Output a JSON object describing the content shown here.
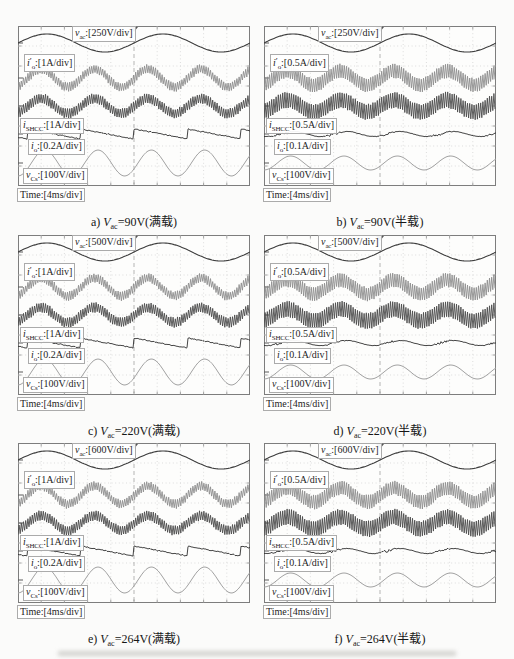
{
  "figure": {
    "background": "#fbfbfa"
  },
  "chart_data": {
    "type": "line",
    "time_per_div": "4ms/div",
    "divisions": {
      "x": 10,
      "y": 8
    },
    "colors": {
      "vac_trace": "#3c3c3c",
      "io_prime_trace": "#8f8f8f",
      "ishcc_trace": "#4c4c4c",
      "io_trace": "#303030",
      "vcs_trace": "#a2a2a2",
      "grid": "#d0d0d0",
      "border": "#7d7d7d"
    },
    "waveform_shapes": {
      "vac": {
        "type": "sine",
        "cycles": 2,
        "center": 17,
        "amp": 9
      },
      "io_prime": {
        "type": "band",
        "cycles": 4.35,
        "phase_peak": 0.1,
        "center": 52,
        "amp_full": 9,
        "amp_half": 7,
        "halfwidth_full": 4,
        "halfwidth_half": 6.5
      },
      "ishcc": {
        "type": "band",
        "cycles": 4.35,
        "phase_peak": 0.1,
        "center": 80,
        "amp_full": 7.5,
        "amp_half": 6,
        "halfwidth_full": 4.5,
        "halfwidth_half": 7.5
      },
      "io_full": {
        "type": "sawtooth",
        "cycles": 4.35,
        "phase": 0.826,
        "center": 108,
        "amp": 5
      },
      "io_half": {
        "type": "ripple",
        "cycles": 4.35,
        "phase_peak": 0.07,
        "center": 108,
        "amp": 2.5
      },
      "vcs": {
        "type": "sine",
        "cycles": 4.35,
        "phase_peak": 0.115,
        "center": 137,
        "amp_full": 13,
        "amp_half": 7
      }
    },
    "panels": [
      {
        "id": "a",
        "load": "full",
        "caption": {
          "prefix": "a) ",
          "var": "V",
          "sub": "ac",
          "rest": "=90V(满载)"
        },
        "labels": {
          "vac": {
            "var": "v",
            "sub": "ac",
            "scale": ":[250V/div]"
          },
          "io_prime": {
            "var": "i",
            "prime": "′",
            "sub": "o",
            "scale": ":[1A/div]"
          },
          "ishcc": {
            "var": "i",
            "sub": "SHCC",
            "scale": ":[1A/div]"
          },
          "io": {
            "var": "i",
            "sub": "o",
            "scale": ":[0.2A/div]"
          },
          "vcs": {
            "var": "v",
            "sub": "Cs",
            "scale": ":[100V/div]"
          },
          "time": "Time:[4ms/div]"
        }
      },
      {
        "id": "b",
        "load": "half",
        "caption": {
          "prefix": "b) ",
          "var": "V",
          "sub": "ac",
          "rest": "=90V(半载)"
        },
        "labels": {
          "vac": {
            "var": "v",
            "sub": "ac",
            "scale": ":[250V/div]"
          },
          "io_prime": {
            "var": "i",
            "prime": "′",
            "sub": "o",
            "scale": ":[0.5A/div]"
          },
          "ishcc": {
            "var": "i",
            "sub": "SHCC",
            "scale": ":[0.5A/div]"
          },
          "io": {
            "var": "i",
            "sub": "o",
            "scale": ":[0.1A/div]"
          },
          "vcs": {
            "var": "v",
            "sub": "Cs",
            "scale": ":[100V/div]"
          },
          "time": "Time:[4ms/div]"
        }
      },
      {
        "id": "c",
        "load": "full",
        "caption": {
          "prefix": "c) ",
          "var": "V",
          "sub": "ac",
          "rest": "=220V(满载)"
        },
        "labels": {
          "vac": {
            "var": "v",
            "sub": "ac",
            "scale": ":[500V/div]"
          },
          "io_prime": {
            "var": "i",
            "prime": "′",
            "sub": "o",
            "scale": ":[1A/div]"
          },
          "ishcc": {
            "var": "i",
            "sub": "SHCC",
            "scale": ":[1A/div]"
          },
          "io": {
            "var": "i",
            "sub": "o",
            "scale": ":[0.2A/div]"
          },
          "vcs": {
            "var": "v",
            "sub": "Cs",
            "scale": ":[100V/div]"
          },
          "time": "Time:[4ms/div]"
        }
      },
      {
        "id": "d",
        "load": "half",
        "caption": {
          "prefix": "d) ",
          "var": "V",
          "sub": "ac",
          "rest": "=220V(半载)"
        },
        "labels": {
          "vac": {
            "var": "v",
            "sub": "ac",
            "scale": ":[500V/div]"
          },
          "io_prime": {
            "var": "i",
            "prime": "′",
            "sub": "o",
            "scale": ":[0.5A/div]"
          },
          "ishcc": {
            "var": "i",
            "sub": "SHCC",
            "scale": ":[0.5A/div]"
          },
          "io": {
            "var": "i",
            "sub": "o",
            "scale": ":[0.1A/div]"
          },
          "vcs": {
            "var": "v",
            "sub": "Cs",
            "scale": ":[100V/div]"
          },
          "time": "Time:[4ms/div]"
        }
      },
      {
        "id": "e",
        "load": "full",
        "caption": {
          "prefix": "e) ",
          "var": "V",
          "sub": "ac",
          "rest": "=264V(满载)"
        },
        "labels": {
          "vac": {
            "var": "v",
            "sub": "ac",
            "scale": ":[600V/div]"
          },
          "io_prime": {
            "var": "i",
            "prime": "′",
            "sub": "o",
            "scale": ":[1A/div]"
          },
          "ishcc": {
            "var": "i",
            "sub": "SHCC",
            "scale": ":[1A/div]"
          },
          "io": {
            "var": "i",
            "sub": "o",
            "scale": ":[0.2A/div]"
          },
          "vcs": {
            "var": "v",
            "sub": "Cs",
            "scale": ":[100V/div]"
          },
          "time": "Time:[4ms/div]"
        }
      },
      {
        "id": "f",
        "load": "half",
        "caption": {
          "prefix": "f) ",
          "var": "V",
          "sub": "ac",
          "rest": "=264V(半载)"
        },
        "labels": {
          "vac": {
            "var": "v",
            "sub": "ac",
            "scale": ":[600V/div]"
          },
          "io_prime": {
            "var": "i",
            "prime": "′",
            "sub": "o",
            "scale": ":[0.5A/div]"
          },
          "ishcc": {
            "var": "i",
            "sub": "SHCC",
            "scale": ":[0.5A/div]"
          },
          "io": {
            "var": "i",
            "sub": "o",
            "scale": ":[0.1A/div]"
          },
          "vcs": {
            "var": "v",
            "sub": "Cs",
            "scale": ":[100V/div]"
          },
          "time": "Time:[4ms/div]"
        }
      }
    ]
  }
}
